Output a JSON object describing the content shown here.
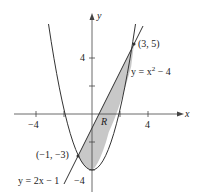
{
  "figure": {
    "type": "region-between-curves",
    "axes": {
      "x_label": "x",
      "y_label": "y",
      "x_ticks": [
        {
          "value": -4,
          "label": "−4"
        },
        {
          "value": 4,
          "label": "4"
        }
      ],
      "y_ticks": [
        {
          "value": 4,
          "label": "4"
        },
        {
          "value": -4,
          "label": "−4"
        }
      ],
      "unit_ticks": [
        -2,
        2
      ]
    },
    "curves": {
      "parabola": {
        "equation_prefix": "y = x",
        "exponent": "2",
        "equation_suffix": " − 4"
      },
      "line": {
        "equation": "y = 2x − 1"
      }
    },
    "points": {
      "upper_intersection": "(3, 5)",
      "lower_intersection": "(−1, −3)"
    },
    "region_label": "R",
    "colors": {
      "region_fill": "#c8c8c8",
      "curve_stroke": "#333333",
      "axis_stroke": "#444444"
    }
  }
}
